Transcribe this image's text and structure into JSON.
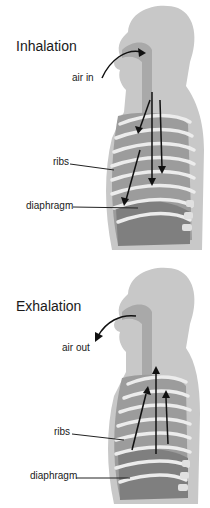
{
  "diagram": {
    "panels": [
      {
        "title": "Inhalation",
        "air_label": "air in",
        "labels": {
          "ribs": "ribs",
          "diaphragm": "diaphragm"
        },
        "arrow_direction": "down"
      },
      {
        "title": "Exhalation",
        "air_label": "air out",
        "labels": {
          "ribs": "ribs",
          "diaphragm": "diaphragm"
        },
        "arrow_direction": "up"
      }
    ],
    "colors": {
      "body": "#c8c8c8",
      "airway": "#a9a9a9",
      "chest": "#9c9c9c",
      "ribs": "#ececec",
      "diaphragm": "#7f7f7f",
      "arrows": "#111111"
    }
  }
}
